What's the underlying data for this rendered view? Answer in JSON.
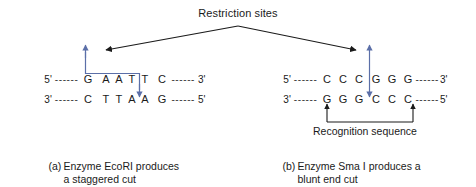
{
  "figure": {
    "title": "Restriction sites",
    "recognition_label": "Recognition sequence"
  },
  "colors": {
    "arrow_blue": "#5b6fa8",
    "line_black": "#1a1a1a",
    "text": "#1a1a1a",
    "background": "#ffffff"
  },
  "panels": [
    {
      "id": "ecori",
      "caption_marker": "(a)",
      "caption_line1": "Enzyme EcoRI produces",
      "caption_line2": "a staggered cut",
      "top_strand": {
        "left_end": "5'",
        "right_end": "3'",
        "left_dashes": "------",
        "right_dashes": "------",
        "bases": [
          "G",
          "A",
          "A",
          "T",
          "T",
          "C"
        ]
      },
      "bottom_strand": {
        "left_end": "3'",
        "right_end": "5'",
        "left_dashes": "------",
        "right_dashes": "------",
        "bases": [
          "C",
          "T",
          "T",
          "A",
          "A",
          "G"
        ]
      },
      "cut_type": "staggered",
      "top_cut_after_base_index": 0,
      "bottom_cut_after_base_index": 4
    },
    {
      "id": "smai",
      "caption_marker": "(b)",
      "caption_line1": "Enzyme Sma I produces a",
      "caption_line2": "blunt end cut",
      "top_strand": {
        "left_end": "5'",
        "right_end": "3'",
        "left_dashes": "------",
        "right_dashes": "------",
        "bases": [
          "C",
          "C",
          "C",
          "G",
          "G",
          "G"
        ]
      },
      "bottom_strand": {
        "left_end": "3'",
        "right_end": "5'",
        "left_dashes": "------",
        "right_dashes": "------",
        "bases": [
          "G",
          "G",
          "G",
          "C",
          "C",
          "C"
        ]
      },
      "cut_type": "blunt",
      "top_cut_after_base_index": 2,
      "bottom_cut_after_base_index": 2
    }
  ]
}
